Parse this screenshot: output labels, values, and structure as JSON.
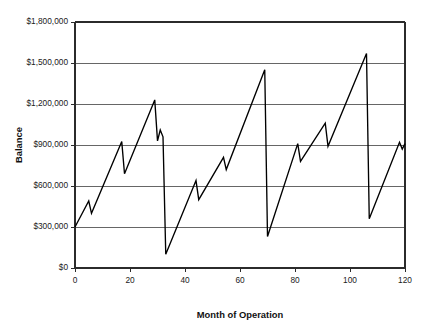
{
  "chart_data": {
    "type": "line",
    "title": "",
    "xlabel": "Month of Operation",
    "ylabel": "Balance",
    "xlim": [
      0,
      120
    ],
    "ylim": [
      0,
      1800000
    ],
    "grid": true,
    "legend": null,
    "legend_position": "none",
    "x_ticks": [
      0,
      20,
      40,
      60,
      80,
      100,
      120
    ],
    "x_tick_labels": [
      "0",
      "20",
      "40",
      "60",
      "80",
      "100",
      "120"
    ],
    "y_ticks": [
      0,
      300000,
      600000,
      900000,
      1200000,
      1500000,
      1800000
    ],
    "y_tick_labels": [
      "$0",
      "$300,000",
      "$600,000",
      "$900,000",
      "$1,200,000",
      "$1,500,000",
      "$1,800,000"
    ],
    "series": [
      {
        "name": "Balance",
        "color": "#000000",
        "x": [
          0,
          5,
          6,
          17,
          18,
          29,
          30,
          31,
          32,
          33,
          44,
          45,
          54,
          55,
          69,
          70,
          81,
          82,
          91,
          92,
          106,
          107,
          118,
          119,
          120
        ],
        "y": [
          300000,
          490000,
          400000,
          925000,
          690000,
          1230000,
          930000,
          1010000,
          960000,
          100000,
          640000,
          500000,
          810000,
          720000,
          1450000,
          230000,
          910000,
          780000,
          1060000,
          890000,
          1570000,
          360000,
          920000,
          870000,
          910000
        ]
      }
    ]
  }
}
